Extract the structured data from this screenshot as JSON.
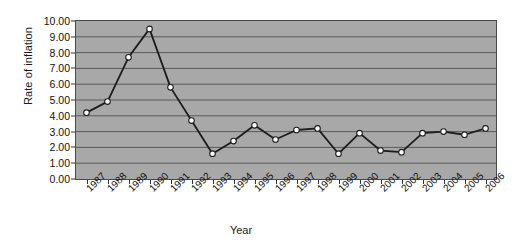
{
  "chart_data": {
    "type": "line",
    "title": "",
    "xlabel": "Year",
    "ylabel": "Rate of inflation",
    "categories": [
      "1987",
      "1988",
      "1989",
      "1990",
      "1991",
      "1992",
      "1993",
      "1994",
      "1995",
      "1996",
      "1997",
      "1998",
      "1999",
      "2000",
      "2001",
      "2002",
      "2003",
      "2004",
      "2005",
      "2006"
    ],
    "values": [
      4.2,
      4.9,
      7.7,
      9.5,
      5.8,
      3.7,
      1.6,
      2.4,
      3.4,
      2.5,
      3.1,
      3.2,
      1.6,
      2.9,
      1.8,
      1.7,
      2.9,
      3.0,
      2.8,
      3.2
    ],
    "ylim": [
      0,
      10
    ],
    "ytick_labels": [
      "0.00",
      "1.00",
      "2.00",
      "3.00",
      "4.00",
      "5.00",
      "6.00",
      "7.00",
      "8.00",
      "9.00",
      "10.00"
    ],
    "ytick_values": [
      0,
      1,
      2,
      3,
      4,
      5,
      6,
      7,
      8,
      9,
      10
    ],
    "grid": true,
    "legend": false,
    "series_name": "Rate of inflation",
    "colors": {
      "plot_background": "#a8a8a8",
      "gridline": "#5a5a5a",
      "line": "#1c1c1c",
      "marker_fill": "#ffffff",
      "marker_edge": "#1c1c1c",
      "axis": "#3a3a3a",
      "text": "#111111"
    }
  }
}
